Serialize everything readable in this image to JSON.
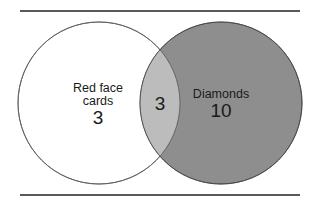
{
  "diagram": {
    "type": "venn",
    "sets": [
      {
        "label_line1": "Red face",
        "label_line2": "cards",
        "only_count": "3",
        "fill": "#ffffff"
      },
      {
        "label": "Diamonds",
        "only_count": "10",
        "fill": "#8e8e8e"
      }
    ],
    "intersection": {
      "count": "3",
      "fill": "#bcbcbc"
    },
    "stroke": "#555555",
    "rule_color": "#222222"
  }
}
